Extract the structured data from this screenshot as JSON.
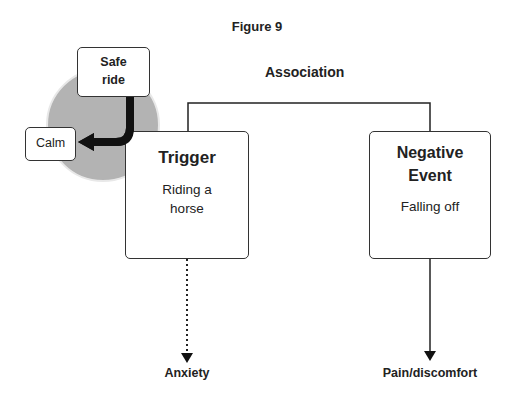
{
  "figure": {
    "title": "Figure 9",
    "association_label": "Association",
    "nodes": {
      "safe_ride": "Safe ride",
      "calm": "Calm",
      "trigger": {
        "title": "Trigger",
        "text": "Riding a horse"
      },
      "negative_event": {
        "title": "Negative Event",
        "text": "Falling off"
      },
      "anxiety": "Anxiety",
      "pain": "Pain/discomfort"
    },
    "colors": {
      "circle_fill": "#b3b3b3",
      "circle_ring": "#e6e6e6",
      "lines": "#222222"
    }
  }
}
